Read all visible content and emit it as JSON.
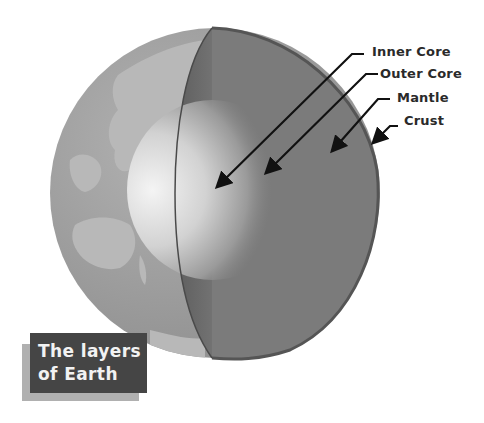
{
  "diagram": {
    "title_line1": "The layers",
    "title_line2": "of Earth",
    "labels": [
      {
        "text": "Inner Core",
        "target": "inner-core"
      },
      {
        "text": "Outer Core",
        "target": "outer-core"
      },
      {
        "text": "Mantle",
        "target": "mantle"
      },
      {
        "text": "Crust",
        "target": "crust"
      }
    ],
    "colors": {
      "ocean": "#9a9a9a",
      "land": "#b4b4b4",
      "mantle": "#7a7a7a",
      "crust_edge": "#555555",
      "inner_core": "#eeeeee",
      "title_bg": "#454545",
      "title_shadow": "#b0b0b0"
    }
  }
}
